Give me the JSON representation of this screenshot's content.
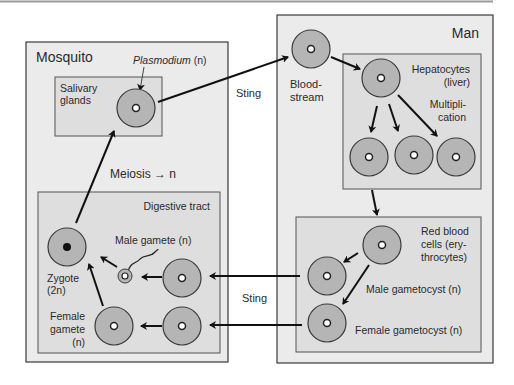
{
  "colors": {
    "outer_box_fill": "#ebebeb",
    "inner_box_fill": "#dedede",
    "cell_fill": "#b5b5b5",
    "stroke": "#3a3a3a",
    "arrow": "#111111",
    "top_rule": "#9a9a9a"
  },
  "mosquito": {
    "title": "Mosquito",
    "plasmodium_label": "Plasmodium",
    "plasmodium_suffix": " (n)",
    "salivary": {
      "line1": "Salivary",
      "line2": "glands"
    },
    "meiosis": "Meiosis → n",
    "digestive": {
      "title": "Digestive tract",
      "male_gamete": "Male gamete (n)",
      "zygote": {
        "line1": "Zygote",
        "line2": "(2n)"
      },
      "female_gamete": {
        "line1": "Female",
        "line2": "gamete",
        "line3": "(n)"
      }
    }
  },
  "man": {
    "title": "Man",
    "bloodstream": {
      "line1": "Blood-",
      "line2": "stream"
    },
    "hepatocytes": {
      "line1": "Hepatocytes",
      "line2": "(liver)"
    },
    "multiplication": {
      "line1": "Multipli-",
      "line2": "cation"
    },
    "rbc": {
      "line1": "Red blood",
      "line2": "cells (ery-",
      "line3": "throcytes)"
    },
    "male_gametocyst": "Male gametocyst (n)",
    "female_gametocyst": "Female gametocyst (n)"
  },
  "arrows": {
    "sting_top": "Sting",
    "sting_bottom": "Sting"
  }
}
